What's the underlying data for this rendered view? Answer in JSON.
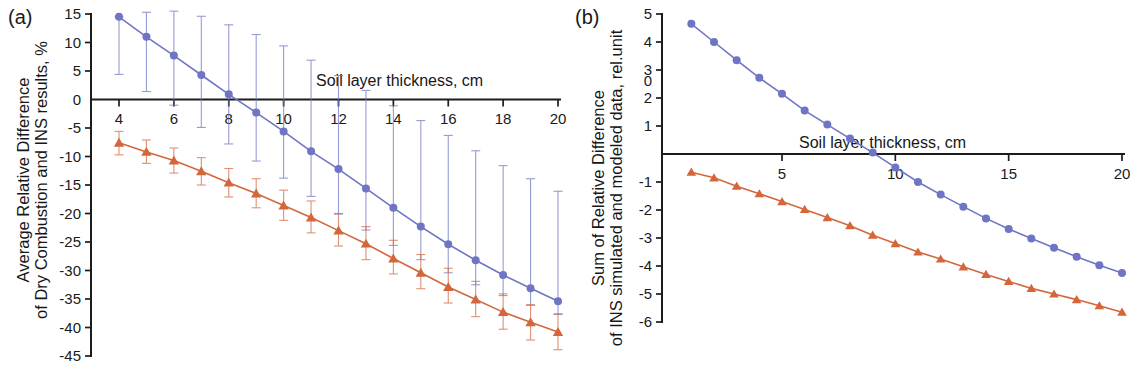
{
  "figure": {
    "panels": [
      {
        "tag": "(a)",
        "ylabel_line1": "Average Relative Difference",
        "ylabel_line2": "of Dry Combustion and INS results, %",
        "xlabel": "Soil layer thickness, cm"
      },
      {
        "tag": "(b)",
        "ylabel_line1": "Sum of Relative Difference",
        "ylabel_line2": "of INS simulated and modeled data, rel.unit",
        "xlabel": "Soil layer thickness, cm"
      }
    ]
  },
  "colors": {
    "series_blue": "#6f75c4",
    "series_orange": "#d4663c",
    "axis": "#1c1c1c",
    "text": "#1a1a1a",
    "background": "#ffffff"
  },
  "chart_data": [
    {
      "type": "line",
      "panel": "(a)",
      "title": "",
      "xlabel": "Soil layer thickness, cm",
      "ylabel": "Average Relative Difference of Dry Combustion and INS results, %",
      "xlim": [
        3.0,
        20.8
      ],
      "ylim": [
        -45,
        15
      ],
      "xticks": [
        4,
        6,
        8,
        10,
        12,
        14,
        16,
        18,
        20
      ],
      "yticks": [
        15,
        10,
        5,
        0,
        -5,
        -10,
        -15,
        -20,
        -25,
        -30,
        -35,
        -40,
        -45
      ],
      "grid": false,
      "legend": "none",
      "x": [
        4,
        5,
        6,
        7,
        8,
        9,
        10,
        11,
        12,
        13,
        14,
        15,
        16,
        17,
        18,
        19,
        20
      ],
      "series": [
        {
          "name": "blue-circles",
          "marker": "circle",
          "color": "#6f75c4",
          "values": [
            14.5,
            11.0,
            7.7,
            4.3,
            0.9,
            -2.3,
            -5.6,
            -9.1,
            -12.2,
            -15.6,
            -19.0,
            -22.3,
            -25.4,
            -28.2,
            -30.8,
            -33.1,
            -35.4
          ],
          "err_upper": [
            14.5,
            15.3,
            15.5,
            14.6,
            13.1,
            11.4,
            9.4,
            6.9,
            4.2,
            1.6,
            -1.1,
            -3.7,
            -6.3,
            -9.0,
            -11.6,
            -13.9,
            -16.1
          ],
          "err_lower": [
            4.4,
            1.4,
            -1.0,
            -4.9,
            -7.8,
            -10.8,
            -13.8,
            -17.0,
            -20.1,
            -22.9,
            -25.6,
            -28.1,
            -30.4,
            -32.5,
            -34.4,
            -36.1,
            -37.7
          ]
        },
        {
          "name": "orange-triangles",
          "marker": "triangle",
          "color": "#d4663c",
          "values": [
            -7.6,
            -9.2,
            -10.7,
            -12.6,
            -14.6,
            -16.5,
            -18.6,
            -20.7,
            -23.0,
            -25.3,
            -27.9,
            -30.4,
            -32.9,
            -35.1,
            -37.3,
            -39.1,
            -40.8
          ],
          "err_upper": [
            -5.6,
            -7.1,
            -8.5,
            -10.2,
            -12.1,
            -13.9,
            -15.9,
            -17.8,
            -20.0,
            -22.3,
            -24.7,
            -27.2,
            -29.6,
            -31.9,
            -34.1,
            -36.0,
            -37.6
          ],
          "err_lower": [
            -9.7,
            -11.2,
            -12.9,
            -15.0,
            -17.1,
            -19.0,
            -21.2,
            -23.4,
            -25.7,
            -28.1,
            -30.6,
            -33.2,
            -35.7,
            -38.1,
            -40.3,
            -42.2,
            -43.9
          ]
        }
      ]
    },
    {
      "type": "line",
      "panel": "(b)",
      "title": "",
      "xlabel": "Soil layer thickness, cm",
      "ylabel": "Sum of Relative Difference of INS simulated and modeled data, rel.unit",
      "xlim": [
        0.2,
        20.5
      ],
      "ylim": [
        -6,
        5
      ],
      "xticks": [
        5,
        10,
        15,
        20
      ],
      "yticks": [
        5,
        4,
        3,
        2,
        1,
        -1,
        -2,
        -3,
        -4,
        -5,
        -6
      ],
      "stray_tick_label": "0",
      "grid": false,
      "legend": "none",
      "x": [
        1,
        2,
        3,
        4,
        5,
        6,
        7,
        8,
        9,
        10,
        11,
        12,
        13,
        14,
        15,
        16,
        17,
        18,
        19,
        20
      ],
      "series": [
        {
          "name": "blue-circles",
          "marker": "circle",
          "color": "#6f75c4",
          "values": [
            4.65,
            4.0,
            3.35,
            2.72,
            2.15,
            1.55,
            1.05,
            0.55,
            0.05,
            -0.48,
            -1.0,
            -1.45,
            -1.88,
            -2.3,
            -2.68,
            -3.02,
            -3.35,
            -3.67,
            -3.97,
            -4.25
          ]
        },
        {
          "name": "orange-triangles",
          "marker": "triangle",
          "color": "#d4663c",
          "values": [
            -0.65,
            -0.85,
            -1.15,
            -1.42,
            -1.7,
            -1.98,
            -2.27,
            -2.56,
            -2.9,
            -3.2,
            -3.5,
            -3.75,
            -4.03,
            -4.3,
            -4.55,
            -4.8,
            -5.0,
            -5.2,
            -5.42,
            -5.65
          ]
        }
      ]
    }
  ]
}
